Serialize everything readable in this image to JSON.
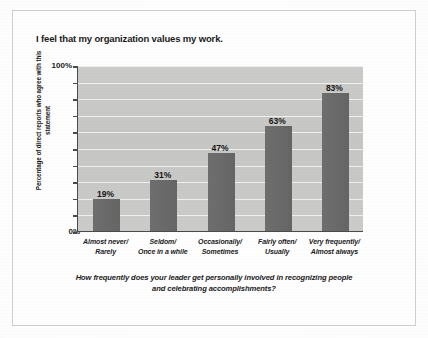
{
  "chart_data": {
    "type": "bar",
    "title": "I feel that my organization values my work.",
    "caption_line1": "How frequently does your leader get personally involved in recognizing people",
    "caption_line2": "and celebrating accomplishments?",
    "categories": [
      "Almost never/ Rarely",
      "Seldom/ Once in a while",
      "Occasionally/ Sometimes",
      "Fairly often/ Usually",
      "Very frequently/ Almost always"
    ],
    "category_lines": [
      [
        "Almost never/",
        "Rarely"
      ],
      [
        "Seldom/",
        "Once in a while"
      ],
      [
        "Occasionally/",
        "Sometimes"
      ],
      [
        "Fairly often/",
        "Usually"
      ],
      [
        "Very frequently/",
        "Almost always"
      ]
    ],
    "values": [
      19,
      31,
      47,
      63,
      83
    ],
    "value_labels": [
      "19%",
      "31%",
      "47%",
      "63%",
      "83%"
    ],
    "xlabel": "",
    "ylabel": "Percentage of direct reports who agree with this statement",
    "ylabel_line1": "Percentage of direct reports who",
    "ylabel_line2": "agree with this statement",
    "ylim": [
      0,
      100
    ],
    "ytick_labels": [
      "0%",
      "100%"
    ],
    "ytick_values": [
      0,
      10,
      20,
      30,
      40,
      50,
      60,
      70,
      80,
      90,
      100
    ],
    "grid": true,
    "grid_interval": 10,
    "legend": null,
    "colors": {
      "bar": "#6a6a6a",
      "plot_background": "#c8c8c6",
      "gridline": "#efefed",
      "axis": "#4a4a4a",
      "text": "#1b1b1b",
      "page_background": "#fdfdfd"
    }
  }
}
